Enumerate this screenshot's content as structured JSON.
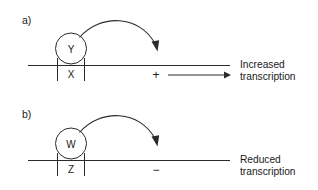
{
  "figure": {
    "background_color": "#ffffff",
    "ink_color": "#2b2b2b",
    "text_color": "#1a1a1a"
  },
  "panels": [
    {
      "letter": "a)",
      "regulator_label": "Y",
      "site_label": "X",
      "sign": "+",
      "outcome_line1": "Increased",
      "outcome_line2": "transcription",
      "has_output_arrow": true
    },
    {
      "letter": "b)",
      "regulator_label": "W",
      "site_label": "Z",
      "sign": "−",
      "outcome_line1": "Reduced",
      "outcome_line2": "transcription",
      "has_output_arrow": false
    }
  ]
}
